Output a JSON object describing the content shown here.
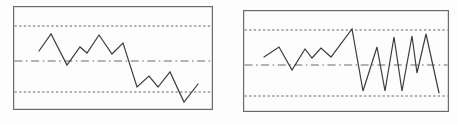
{
  "figure": {
    "background": "#fdfdfd",
    "width": 458,
    "height": 125
  },
  "style": {
    "border_color": "#6b6b6b",
    "ref_line_color": "#585858",
    "series_color": "#3c3c3c",
    "border_width": 1.2,
    "ref_line_width": 0.9,
    "series_width": 1.2,
    "dash_patterns": {
      "dashed": "2.4 2.2",
      "dashdot": "8 3.5 1.6 3.5"
    }
  },
  "chart_data": [
    {
      "name": "control-chart-left",
      "type": "line",
      "title": "",
      "frame": {
        "x": 13,
        "y": 6,
        "width": 200,
        "height": 104
      },
      "reference_lines": [
        {
          "name": "upper-limit-line",
          "style": "dashed",
          "y": 20
        },
        {
          "name": "center-line",
          "style": "dashdot",
          "y": 55
        },
        {
          "name": "lower-limit-line",
          "style": "dashed",
          "y": 86
        }
      ],
      "points": [
        [
          26,
          45
        ],
        [
          38,
          28
        ],
        [
          54,
          59
        ],
        [
          67,
          41
        ],
        [
          74,
          47
        ],
        [
          86,
          29
        ],
        [
          99,
          48
        ],
        [
          110,
          37
        ],
        [
          124,
          81
        ],
        [
          136,
          70
        ],
        [
          145,
          81
        ],
        [
          157,
          66
        ],
        [
          171,
          96
        ],
        [
          185,
          78
        ]
      ]
    },
    {
      "name": "control-chart-right",
      "type": "line",
      "title": "",
      "frame": {
        "x": 243,
        "y": 10,
        "width": 206,
        "height": 102
      },
      "reference_lines": [
        {
          "name": "upper-limit-line",
          "style": "dashed",
          "y": 20
        },
        {
          "name": "center-line",
          "style": "dashdot",
          "y": 55
        },
        {
          "name": "lower-limit-line",
          "style": "dashed",
          "y": 86
        }
      ],
      "points": [
        [
          21,
          47
        ],
        [
          36,
          37
        ],
        [
          49,
          60
        ],
        [
          62,
          39
        ],
        [
          69,
          48
        ],
        [
          78,
          38
        ],
        [
          88,
          47
        ],
        [
          109,
          19
        ],
        [
          120,
          81
        ],
        [
          134,
          37
        ],
        [
          142,
          81
        ],
        [
          151,
          27
        ],
        [
          159,
          81
        ],
        [
          169,
          26
        ],
        [
          174,
          63
        ],
        [
          183,
          24
        ],
        [
          196,
          83
        ]
      ]
    }
  ]
}
